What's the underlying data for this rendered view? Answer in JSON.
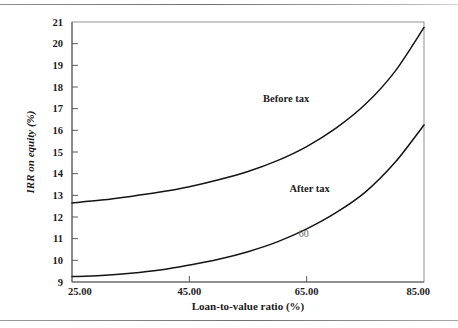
{
  "chart_data": {
    "type": "line",
    "title": "",
    "xlabel": "Loan-to-value ratio (%)",
    "ylabel": "IRR on equity (%)",
    "xlim": [
      25.0,
      85.0
    ],
    "ylim": [
      9,
      21
    ],
    "grid": false,
    "legend_position": "inline-annotations",
    "xticks": [
      25.0,
      45.0,
      65.0,
      85.0
    ],
    "xtick_labels": [
      "25.00",
      "45.00",
      "65.00",
      "85.00"
    ],
    "yticks": [
      9,
      10,
      11,
      12,
      13,
      14,
      15,
      16,
      17,
      18,
      19,
      20,
      21
    ],
    "ytick_labels": [
      "9",
      "10",
      "11",
      "12",
      "13",
      "14",
      "15",
      "16",
      "17",
      "18",
      "19",
      "20",
      "21"
    ],
    "x": [
      25,
      30,
      35,
      40,
      45,
      50,
      55,
      60,
      65,
      70,
      75,
      80,
      85
    ],
    "series": [
      {
        "name": "Before tax",
        "label_x": 61.5,
        "label_y": 17.45,
        "values": [
          12.65,
          12.78,
          12.95,
          13.15,
          13.4,
          13.72,
          14.1,
          14.6,
          15.25,
          16.1,
          17.2,
          18.7,
          20.75
        ]
      },
      {
        "name": "After tax",
        "label_x": 65.5,
        "label_y": 13.3,
        "values": [
          9.25,
          9.3,
          9.4,
          9.55,
          9.78,
          10.05,
          10.4,
          10.85,
          11.45,
          12.2,
          13.15,
          14.5,
          16.25
        ]
      }
    ],
    "annotations": [
      {
        "text": "60",
        "x": 64.5,
        "y": 11.25
      }
    ],
    "colors": {
      "curve": "#141414",
      "axis": "#5a5a5a",
      "frame": "#8f8f8f",
      "text": "#1b1b1b",
      "annotation": "#6b6b6b"
    }
  }
}
